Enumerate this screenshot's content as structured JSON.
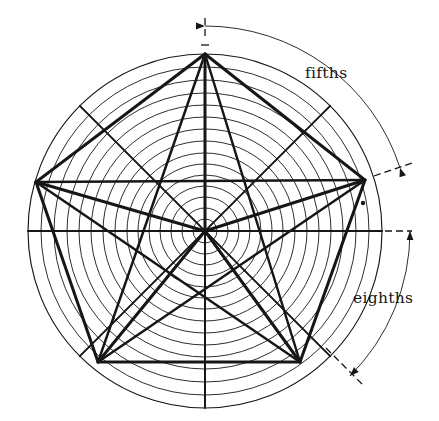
{
  "figure": {
    "type": "polar-grid-diagram",
    "background_color": "#ffffff",
    "line_color": "#161616",
    "thin_line_width": 0.9,
    "thick_line_width": 3.0,
    "center": {
      "x": 205,
      "y": 231
    },
    "outer_radius": 177,
    "ring_count": 14,
    "ring_radii": [
      177,
      164,
      151,
      138,
      126,
      114,
      102,
      90,
      78,
      67,
      56,
      45,
      34,
      23,
      12
    ],
    "spoke_count": 8,
    "spoke_label": "eighths",
    "spoke_angles_deg": [
      90,
      45,
      0,
      -45,
      -90,
      -135,
      180,
      135
    ],
    "pentagon_label": "fifths",
    "pentagon_vertex_count": 5,
    "pentagon_vertices": [
      {
        "x": 205,
        "y": 54
      },
      {
        "x": 365,
        "y": 180
      },
      {
        "x": 300,
        "y": 362
      },
      {
        "x": 98,
        "y": 362
      },
      {
        "x": 36,
        "y": 182
      }
    ],
    "marker_dot": {
      "x": 363,
      "y": 203,
      "radius": 2.2
    }
  },
  "annotations": {
    "fifths": {
      "label": "fifths",
      "label_x": 305,
      "label_y": 78,
      "arc_start_deg": 90,
      "arc_end_deg": 18,
      "arc_radius": 205,
      "arrow_head_at": "both-ends",
      "tick_top": {
        "x": 205,
        "y": 18,
        "length": 22,
        "style": "dashed-vertical"
      },
      "tick_right": {
        "x1": 374,
        "y1": 176,
        "x2": 412,
        "y2": 163,
        "style": "dashed"
      }
    },
    "eighths": {
      "label": "eighths",
      "label_x": 353,
      "label_y": 303,
      "arc_start_deg": 0,
      "arc_end_deg": -45,
      "arc_radius": 205,
      "arrow_head_at": "both-ends",
      "tick_right": {
        "x1": 374,
        "y1": 231,
        "x2": 412,
        "y2": 231,
        "style": "dashed-horizontal"
      },
      "tick_lower_right": {
        "x1": 326,
        "y1": 348,
        "x2": 362,
        "y2": 384,
        "style": "dashed"
      }
    }
  },
  "labels": [
    {
      "name": "fifths-label",
      "text": "fifths"
    },
    {
      "name": "eighths-label",
      "text": "eighths"
    }
  ]
}
